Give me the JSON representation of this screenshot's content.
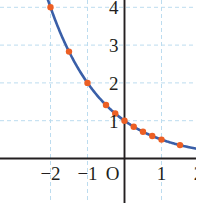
{
  "chart_data": {
    "type": "line",
    "title": "",
    "subtitle": "",
    "xlabel": "",
    "ylabel": "",
    "function": "y = (1/2)^x",
    "xlim": [
      -2.35,
      2.05
    ],
    "ylim": [
      -0.2,
      4.3
    ],
    "grid": true,
    "grid_color": "#bcdcef",
    "grid_style": "dashed",
    "axis_color": "#231f20",
    "legend": "none",
    "curve": {
      "name": "y = (1/2)^x",
      "color": "#3a5fa8",
      "width": 2.6
    },
    "points": {
      "color": "#ec5f24",
      "radius": 3.2,
      "x": [
        -2,
        -1.5,
        -1,
        -0.5,
        -0.25,
        0,
        0.25,
        0.5,
        0.75,
        1,
        1.5
      ],
      "y": [
        4,
        2.828,
        2,
        1.414,
        1.189,
        1,
        0.841,
        0.707,
        0.595,
        0.5,
        0.354
      ]
    },
    "x_ticks": [
      {
        "value": -2,
        "label": "−2"
      },
      {
        "value": -1,
        "label": "−1"
      },
      {
        "value": 0,
        "label": "O"
      },
      {
        "value": 1,
        "label": "1"
      },
      {
        "value": 2,
        "label": "2"
      }
    ],
    "y_ticks": [
      {
        "value": 1,
        "label": "1"
      },
      {
        "value": 2,
        "label": "2"
      },
      {
        "value": 3,
        "label": "3"
      },
      {
        "value": 4,
        "label": "4"
      }
    ],
    "gridlines_x": [
      -2,
      -1,
      0,
      1,
      2
    ],
    "gridlines_y": [
      1,
      2,
      3,
      4
    ]
  }
}
